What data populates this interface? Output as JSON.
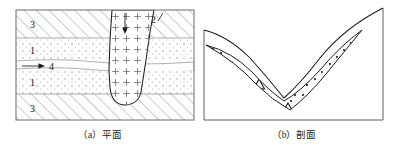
{
  "figure": {
    "title": "",
    "panels": [
      {
        "id": "a",
        "caption": "（a）平面",
        "caption_prefix": "（a）",
        "caption_text": "平面",
        "type": "plan-view",
        "frame": {
          "x": 16,
          "y": 10,
          "w": 178,
          "h": 110
        },
        "layers": [
          {
            "index": 0,
            "label": "3",
            "pattern": "diagonal-hatch",
            "y": 10,
            "h": 28,
            "label_x": 30,
            "label_y": 28
          },
          {
            "index": 1,
            "label": "1",
            "pattern": "dotted",
            "y": 38,
            "h": 22,
            "label_x": 30,
            "label_y": 54
          },
          {
            "index": 2,
            "label": "4",
            "pattern": "channel",
            "y": 60,
            "h": 10,
            "label_x": 50,
            "label_y": 70
          },
          {
            "index": 3,
            "label": "1",
            "pattern": "dotted",
            "y": 70,
            "h": 24,
            "label_x": 30,
            "label_y": 86
          },
          {
            "index": 4,
            "label": "3",
            "pattern": "diagonal-hatch",
            "y": 94,
            "h": 26,
            "label_x": 30,
            "label_y": 112
          }
        ],
        "intrusion": {
          "label": "2",
          "pattern": "plus-signs",
          "label_x": 153,
          "label_y": 22,
          "arrow": {
            "x": 125,
            "y1": 14,
            "y2": 33,
            "direction": "down"
          }
        },
        "flow_arrow": {
          "label": "4",
          "x1": 22,
          "x2": 44,
          "y": 66,
          "direction": "right"
        }
      },
      {
        "id": "b",
        "caption": "（b）剖面",
        "caption_prefix": "（b）",
        "caption_text": "剖面",
        "type": "cross-section",
        "frame": {
          "left_x": 204,
          "right_x": 383,
          "top_y": 8,
          "bottom_y": 120
        },
        "deposit": {
          "pattern": "dots-and-triangles",
          "triangle_count": 6,
          "dot_count": 46
        }
      }
    ],
    "colors": {
      "line": "#1b1b1b",
      "hatch": "#8c8c8c",
      "dot": "#9a9a9a",
      "plus": "#7a7a7a",
      "background": "#ffffff",
      "caption": "#1b1b1b"
    }
  }
}
